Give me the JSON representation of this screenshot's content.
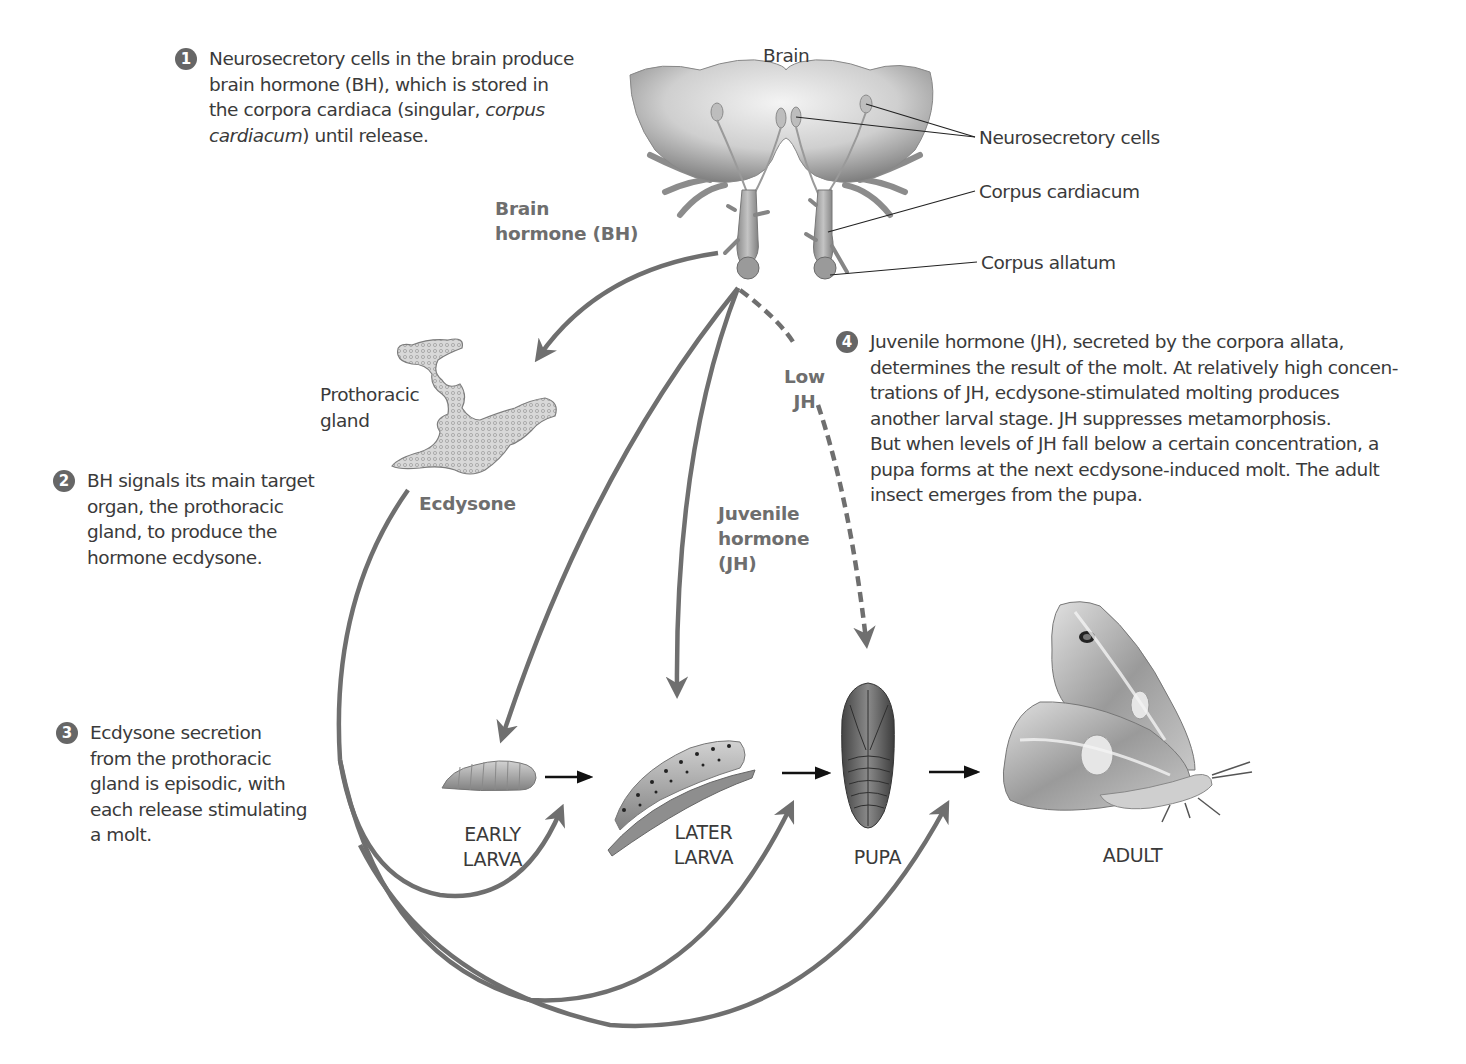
{
  "steps": [
    {
      "number": "1",
      "lines": [
        "Neurosecretory cells in the brain produce",
        "brain hormone (BH), which is stored in",
        "the corpora cardiaca (singular, ",
        "cardiacum) until release."
      ],
      "italic_fragments": [
        "corpus",
        "cardiacum"
      ]
    },
    {
      "number": "2",
      "lines": [
        "BH signals its main target",
        "organ, the prothoracic",
        "gland, to produce the",
        "hormone ecdysone."
      ]
    },
    {
      "number": "3",
      "lines": [
        "Ecdysone secretion",
        "from the prothoracic",
        "gland is episodic, with",
        "each release stimulating",
        "a molt."
      ]
    },
    {
      "number": "4",
      "lines": [
        "Juvenile hormone (JH), secreted by the corpora allata,",
        "determines the result of the molt. At relatively high concen-",
        "trations of JH, ecdysone-stimulated molting produces",
        "another larval stage. JH suppresses metamorphosis.",
        "But when levels of JH fall below a certain concentration, a",
        "pupa forms at the next ecdysone-induced molt. The adult",
        "insect emerges from the pupa."
      ]
    }
  ],
  "anatomy_labels": {
    "brain": "Brain",
    "neurosecretory_cells": "Neurosecretory cells",
    "corpus_cardiacum": "Corpus cardiacum",
    "corpus_allatum": "Corpus allatum",
    "prothoracic_gland_line1": "Prothoracic",
    "prothoracic_gland_line2": "gland"
  },
  "hormone_labels": {
    "bh_line1": "Brain",
    "bh_line2": "hormone (BH)",
    "ecdysone": "Ecdysone",
    "jh_line1": "Juvenile",
    "jh_line2": "hormone",
    "jh_line3": "(JH)",
    "low_jh_line1": "Low",
    "low_jh_line2": "JH"
  },
  "stages": [
    {
      "line1": "EARLY",
      "line2": "LARVA"
    },
    {
      "line1": "LATER",
      "line2": "LARVA"
    },
    {
      "line1": "PUPA",
      "line2": ""
    },
    {
      "line1": "ADULT",
      "line2": ""
    }
  ],
  "colors": {
    "arrow_gray": "#6f6f6f",
    "text": "#3a3a3a",
    "bold_label": "#6e6e6e",
    "step_badge": "#666666",
    "black_arrow": "#111111"
  }
}
